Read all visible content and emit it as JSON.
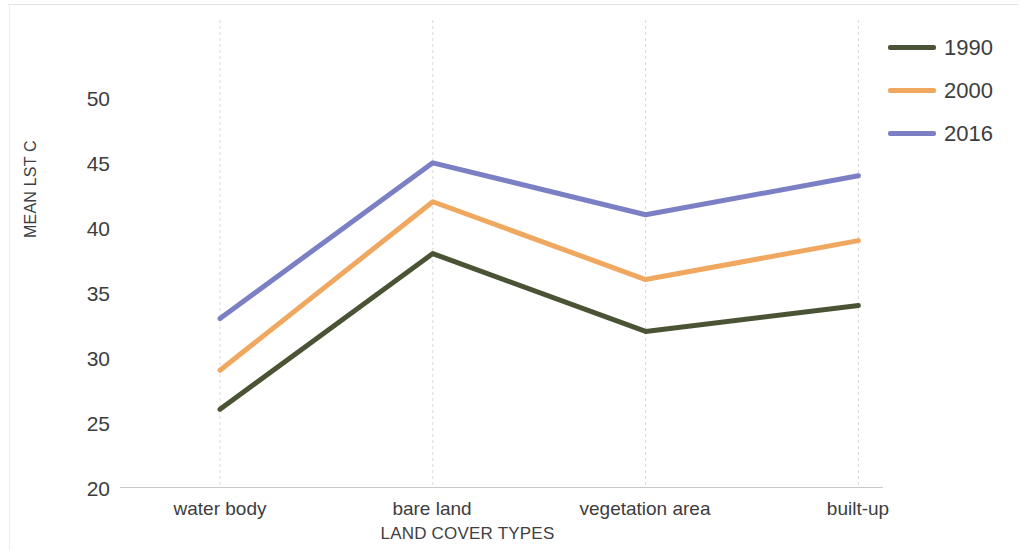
{
  "chart_data": {
    "type": "line",
    "title": "",
    "xlabel": "LAND COVER TYPES",
    "ylabel": "MEAN LST C",
    "categories": [
      "water body",
      "bare land",
      "vegetation area",
      "built-up"
    ],
    "series": [
      {
        "name": "1990",
        "color": "#4A5434",
        "values": [
          26,
          38,
          32,
          34
        ]
      },
      {
        "name": "2000",
        "color": "#F0A860",
        "values": [
          29,
          42,
          36,
          39
        ]
      },
      {
        "name": "2016",
        "color": "#7B7FC4",
        "values": [
          33,
          45,
          41,
          44
        ]
      }
    ],
    "ylim": [
      20,
      50
    ],
    "yticks": [
      50,
      45,
      40,
      35,
      30,
      25,
      20
    ],
    "ytick_labels": [
      "50",
      "45",
      "40",
      "35",
      "30",
      "25",
      "20"
    ],
    "grid": "vertical-category-gridlines",
    "gridline_color": "#d9d9d9",
    "axis_color": "#c9c9c9",
    "legend_position": "right-top",
    "background": "#ffffff"
  },
  "legend": {
    "entries": [
      {
        "label": "1990",
        "color": "#4A5434"
      },
      {
        "label": "2000",
        "color": "#F0A860"
      },
      {
        "label": "2016",
        "color": "#7B7FC4"
      }
    ]
  },
  "axes": {
    "y_title": "MEAN LST C",
    "x_title": "LAND COVER TYPES",
    "y_tick_0": "50",
    "y_tick_1": "45",
    "y_tick_2": "40",
    "y_tick_3": "35",
    "y_tick_4": "30",
    "y_tick_5": "25",
    "y_tick_6": "20",
    "x_tick_0": "water body",
    "x_tick_1": "bare land",
    "x_tick_2": "vegetation area",
    "x_tick_3": "built-up"
  }
}
